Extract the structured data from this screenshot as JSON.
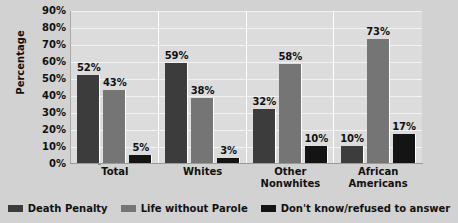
{
  "chart_data": {
    "type": "bar",
    "title": "",
    "subtitle": "",
    "xlabel": "",
    "ylabel": "Percentage",
    "ylim": [
      0,
      90
    ],
    "ytick_step": 10,
    "ytick_labels": [
      "90%",
      "80%",
      "70%",
      "60%",
      "50%",
      "40%",
      "30%",
      "20%",
      "10%",
      "0%"
    ],
    "ytick_values": [
      90,
      80,
      70,
      60,
      50,
      40,
      30,
      20,
      10,
      0
    ],
    "grid": true,
    "legend_position": "bottom",
    "categories": [
      "Total",
      "Whites",
      "Other Nonwhites",
      "African Americans"
    ],
    "category_lines": [
      [
        "Total"
      ],
      [
        "Whites"
      ],
      [
        "Other",
        "Nonwhites"
      ],
      [
        "African",
        "Americans"
      ]
    ],
    "series": [
      {
        "name": "Death Penalty",
        "color": "#3c3c3c",
        "values": [
          52,
          59,
          32,
          10
        ],
        "labels": [
          "52%",
          "59%",
          "32%",
          "10%"
        ]
      },
      {
        "name": "Life without Parole",
        "color": "#757575",
        "values": [
          43,
          38,
          58,
          73
        ],
        "labels": [
          "43%",
          "38%",
          "58%",
          "73%"
        ]
      },
      {
        "name": "Don't know/refused to answer",
        "color": "#141414",
        "values": [
          5,
          3,
          10,
          17
        ],
        "labels": [
          "5%",
          "3%",
          "10%",
          "17%"
        ]
      }
    ]
  },
  "colors": {
    "page_background": "#d2d2d2",
    "plot_background": "#dcdcdc",
    "gridline": "#f2f2f2",
    "axis": "#9a9a9a",
    "text": "#111111"
  }
}
